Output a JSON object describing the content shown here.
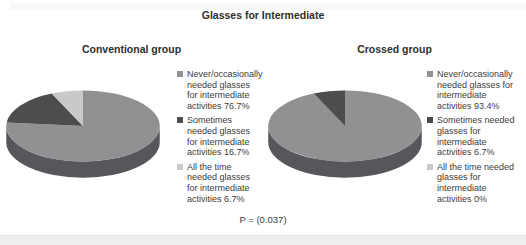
{
  "page": {
    "title": "Glasses for Intermediate",
    "p_value": "P = (0.037)"
  },
  "colors": {
    "slice_never_occasionally": "#8f9192",
    "slice_sometimes": "#4b4d4f",
    "slice_all_the_time": "#c8c9c9",
    "pie_side_wall": "#55575a",
    "text": "#3c3c3c",
    "bottom_band": "#efefef"
  },
  "chart_data": [
    {
      "type": "pie",
      "style": "3d-pie",
      "title": "Conventional group",
      "categories": [
        "Never/occasionally needed glasses for intermediate activities",
        "Sometimes needed glasses for intermediate activities",
        "All the time needed glasses for intermediate activities"
      ],
      "values": [
        76.7,
        16.7,
        6.7
      ],
      "unit": "%",
      "colors": [
        "#8f9192",
        "#4b4d4f",
        "#c8c9c9"
      ],
      "start_angle_deg": 0,
      "direction": "clockwise",
      "legend_position": "right",
      "legend": [
        "Never/occasionally needed glasses for intermediate activities 76.7%",
        "Sometimes needed glasses for intermediate activities 16.7%",
        "All the time needed glasses for intermediate activities 6.7%"
      ]
    },
    {
      "type": "pie",
      "style": "3d-pie",
      "title": "Crossed group",
      "categories": [
        "Never/occasionally needed glasses for intermediate activities",
        "Sometimes needed glasses for intermediate activities",
        "All the time needed glasses for intermediate activities"
      ],
      "values": [
        93.4,
        6.7,
        0
      ],
      "unit": "%",
      "colors": [
        "#8f9192",
        "#4b4d4f",
        "#c8c9c9"
      ],
      "start_angle_deg": 0,
      "direction": "clockwise",
      "legend_position": "right",
      "legend": [
        "Never/occasionally needed glasses for intermediate activities 93.4%",
        "Sometimes needed glasses for intermediate activities 6.7%",
        "All the time needed glasses for intermediate activities 0%"
      ]
    }
  ]
}
